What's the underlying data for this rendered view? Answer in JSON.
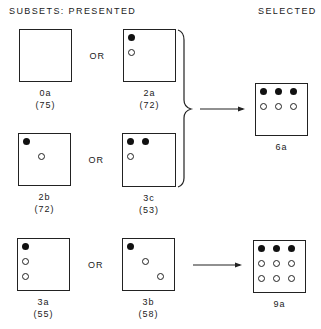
{
  "headers": {
    "presented": "SUBSETS:  PRESENTED",
    "selected": "SELECTED"
  },
  "or_label": "OR",
  "rows": [
    {
      "options": [
        {
          "id": "0a",
          "score": "(75)",
          "box": [
            19,
            29,
            53,
            53
          ],
          "dots": []
        },
        {
          "id": "2a",
          "score": "(72)",
          "box": [
            123,
            29,
            53,
            53
          ],
          "dots": [
            {
              "type": "filled",
              "x": 8,
              "y": 8
            },
            {
              "type": "open",
              "x": 8,
              "y": 23
            }
          ]
        }
      ]
    },
    {
      "options": [
        {
          "id": "2b",
          "score": "(72)",
          "box": [
            18,
            133,
            53,
            53
          ],
          "dots": [
            {
              "type": "filled",
              "x": 8,
              "y": 8
            },
            {
              "type": "open",
              "x": 23,
              "y": 23
            }
          ]
        },
        {
          "id": "3c",
          "score": "(53)",
          "box": [
            122,
            133,
            54,
            54
          ],
          "dots": [
            {
              "type": "filled",
              "x": 8,
              "y": 8
            },
            {
              "type": "filled",
              "x": 23,
              "y": 8
            },
            {
              "type": "open",
              "x": 8,
              "y": 23
            }
          ]
        }
      ]
    },
    {
      "options": [
        {
          "id": "3a",
          "score": "(55)",
          "box": [
            17,
            238,
            53,
            53
          ],
          "dots": [
            {
              "type": "filled",
              "x": 8,
              "y": 8
            },
            {
              "type": "open",
              "x": 8,
              "y": 23
            },
            {
              "type": "open",
              "x": 8,
              "y": 38
            }
          ]
        },
        {
          "id": "3b",
          "score": "(58)",
          "box": [
            122,
            238,
            53,
            53
          ],
          "dots": [
            {
              "type": "filled",
              "x": 8,
              "y": 8
            },
            {
              "type": "open",
              "x": 23,
              "y": 23
            },
            {
              "type": "open",
              "x": 38,
              "y": 38
            }
          ]
        }
      ]
    }
  ],
  "selected": [
    {
      "id": "6a",
      "box": [
        255,
        83,
        53,
        53
      ],
      "dots": [
        {
          "type": "filled",
          "x": 8,
          "y": 8
        },
        {
          "type": "filled",
          "x": 23,
          "y": 8
        },
        {
          "type": "filled",
          "x": 38,
          "y": 8
        },
        {
          "type": "open",
          "x": 8,
          "y": 23
        },
        {
          "type": "open",
          "x": 23,
          "y": 23
        },
        {
          "type": "open",
          "x": 38,
          "y": 23
        }
      ]
    },
    {
      "id": "9a",
      "box": [
        253,
        240,
        53,
        53
      ],
      "dots": [
        {
          "type": "filled",
          "x": 8,
          "y": 8
        },
        {
          "type": "filled",
          "x": 23,
          "y": 8
        },
        {
          "type": "filled",
          "x": 38,
          "y": 8
        },
        {
          "type": "open",
          "x": 8,
          "y": 23
        },
        {
          "type": "open",
          "x": 23,
          "y": 23
        },
        {
          "type": "open",
          "x": 38,
          "y": 23
        },
        {
          "type": "open",
          "x": 8,
          "y": 38
        },
        {
          "type": "open",
          "x": 23,
          "y": 38
        },
        {
          "type": "open",
          "x": 38,
          "y": 38
        }
      ]
    }
  ]
}
